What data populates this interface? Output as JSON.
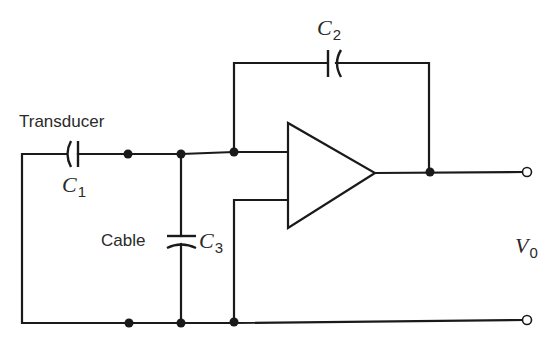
{
  "diagram": {
    "labels": {
      "transducer": "Transducer",
      "cable": "Cable",
      "c1": {
        "symbol": "C",
        "subscript": "1"
      },
      "c2": {
        "symbol": "C",
        "subscript": "2"
      },
      "c3": {
        "symbol": "C",
        "subscript": "3"
      },
      "vout": {
        "symbol": "V",
        "subscript": "0"
      }
    },
    "components": [
      {
        "id": "C1",
        "type": "capacitor",
        "role": "transducer",
        "orientation": "horizontal"
      },
      {
        "id": "C2",
        "type": "capacitor",
        "role": "feedback",
        "orientation": "horizontal"
      },
      {
        "id": "C3",
        "type": "capacitor",
        "role": "cable",
        "orientation": "vertical"
      },
      {
        "id": "A1",
        "type": "op-amp"
      }
    ],
    "terminals": [
      {
        "id": "out_top",
        "label": "V0 +"
      },
      {
        "id": "out_bottom",
        "label": "V0 -"
      }
    ],
    "colors": {
      "line": "#1a1a1a",
      "text": "#2a2a2a",
      "background": "#ffffff"
    }
  }
}
